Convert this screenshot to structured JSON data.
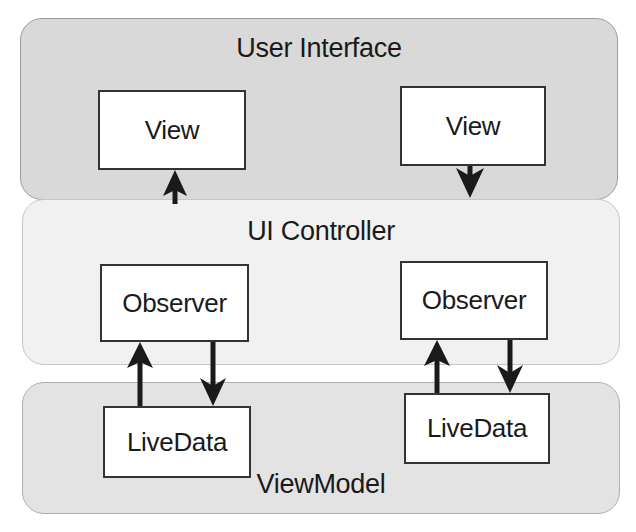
{
  "diagram": {
    "layers": {
      "user_interface": {
        "title": "User Interface"
      },
      "ui_controller": {
        "title": "UI Controller"
      },
      "viewmodel": {
        "title": "ViewModel"
      }
    },
    "nodes": {
      "view_left": "View",
      "view_right": "View",
      "observer_left": "Observer",
      "observer_right": "Observer",
      "livedata_left": "LiveData",
      "livedata_right": "LiveData"
    },
    "edges": [
      {
        "from": "UI Controller",
        "to": "View (left)",
        "direction": "up"
      },
      {
        "from": "View (right)",
        "to": "UI Controller",
        "direction": "down"
      },
      {
        "from": "LiveData (left)",
        "to": "Observer (left)",
        "direction": "up"
      },
      {
        "from": "Observer (left)",
        "to": "LiveData (left)",
        "direction": "down"
      },
      {
        "from": "LiveData (right)",
        "to": "Observer (right)",
        "direction": "up"
      },
      {
        "from": "Observer (right)",
        "to": "LiveData (right)",
        "direction": "down"
      }
    ],
    "colors": {
      "ui_layer_fill": "#d9d9d9",
      "controller_layer_fill": "#f1f1f1",
      "viewmodel_layer_fill": "#e3e3e3",
      "box_fill": "#ffffff",
      "stroke": "#1a1a1a"
    }
  }
}
